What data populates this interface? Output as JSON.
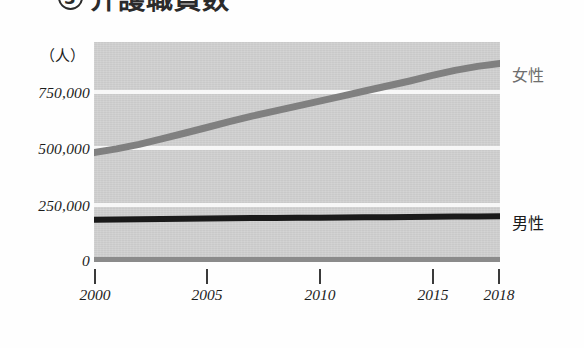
{
  "title": {
    "marker": "3",
    "text": "介護職員数",
    "note": "clipped at top edge of frame"
  },
  "axes": {
    "y_unit": "（人）",
    "y_ticks": [
      "750,000",
      "500,000",
      "250,000",
      "0"
    ],
    "x_ticks": [
      "2000",
      "2005",
      "2010",
      "2015",
      "2018"
    ]
  },
  "legend": {
    "female": "女性",
    "male": "男性"
  },
  "colors": {
    "plot_background": "#d2d2d2",
    "gridline": "#f7f7f7",
    "zero_line": "#8b8b8b",
    "female_line": "#808080",
    "male_line": "#1a1a1a",
    "axis_text": "#1c1c1c"
  },
  "chart_data": {
    "type": "line",
    "title": "介護職員数",
    "xlabel": "",
    "ylabel": "（人）",
    "xlim": [
      2000,
      2018
    ],
    "ylim": [
      0,
      875000
    ],
    "ytick_values": [
      0,
      250000,
      500000,
      750000
    ],
    "ytick_labels": [
      "0",
      "250,000",
      "500,000",
      "750,000"
    ],
    "xtick_values": [
      2000,
      2005,
      2010,
      2015,
      2018
    ],
    "xtick_labels": [
      "2000",
      "2005",
      "2010",
      "2015",
      "2018"
    ],
    "grid": "horizontal",
    "legend_position": "right-of-line-ends",
    "x": [
      2000,
      2001,
      2002,
      2003,
      2004,
      2005,
      2006,
      2007,
      2008,
      2009,
      2010,
      2011,
      2012,
      2013,
      2014,
      2015,
      2016,
      2017,
      2018
    ],
    "series": [
      {
        "name": "女性",
        "color": "#808080",
        "values": [
          435000,
          450000,
          468000,
          490000,
          512000,
          535000,
          558000,
          580000,
          600000,
          620000,
          640000,
          660000,
          680000,
          700000,
          720000,
          742000,
          762000,
          778000,
          790000
        ]
      },
      {
        "name": "男性",
        "color": "#1a1a1a",
        "values": [
          168000,
          169000,
          170000,
          171000,
          172000,
          173000,
          174000,
          175000,
          175000,
          176000,
          176000,
          177000,
          178000,
          178000,
          179000,
          180000,
          181000,
          181000,
          182000
        ]
      }
    ]
  }
}
